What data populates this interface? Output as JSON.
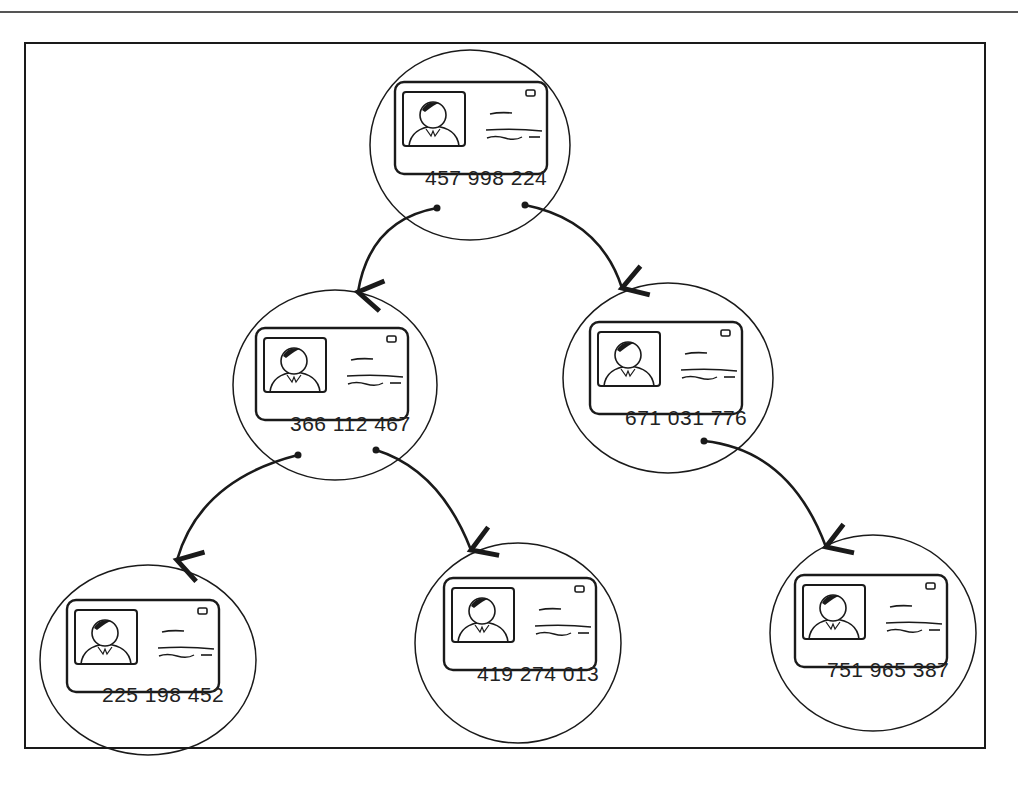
{
  "diagram": {
    "type": "binary-tree",
    "nodes": [
      {
        "id": "root",
        "number": "457 998 224",
        "cx": 470,
        "cy": 145,
        "rx": 100,
        "ry": 95
      },
      {
        "id": "left",
        "number": "366 112 467",
        "cx": 335,
        "cy": 385,
        "rx": 102,
        "ry": 95
      },
      {
        "id": "right",
        "number": "671 031 776",
        "cx": 668,
        "cy": 378,
        "rx": 105,
        "ry": 95
      },
      {
        "id": "left-left",
        "number": "225 198 452",
        "cx": 148,
        "cy": 660,
        "rx": 108,
        "ry": 95
      },
      {
        "id": "left-right",
        "number": "419 274 013",
        "cx": 518,
        "cy": 643,
        "rx": 103,
        "ry": 100
      },
      {
        "id": "right-right",
        "number": "751 965 387",
        "cx": 873,
        "cy": 633,
        "rx": 103,
        "ry": 98
      }
    ],
    "edges": [
      {
        "from": "root",
        "to": "left",
        "label": ""
      },
      {
        "from": "root",
        "to": "right",
        "label": ""
      },
      {
        "from": "left",
        "to": "left-left",
        "label": ""
      },
      {
        "from": "left",
        "to": "left-right",
        "label": ""
      },
      {
        "from": "right",
        "to": "right-right",
        "label": ""
      }
    ]
  },
  "colors": {
    "stroke": "#1a1a1a",
    "background": "#ffffff"
  }
}
